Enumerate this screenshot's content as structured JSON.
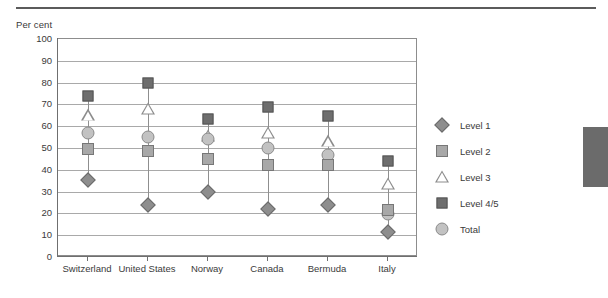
{
  "axis_unit_label": "Per cent",
  "legend": {
    "items": [
      {
        "label": "Level 1",
        "marker": "diamond-icon"
      },
      {
        "label": "Level 2",
        "marker": "square-light-icon"
      },
      {
        "label": "Level 3",
        "marker": "triangle-outline-icon"
      },
      {
        "label": "Level 4/5",
        "marker": "square-dark-icon"
      },
      {
        "label": "Total",
        "marker": "circle-icon"
      }
    ]
  },
  "colors": {
    "level1": "#8e8e8e",
    "level2": "#a8a8a8",
    "level3": "#ffffff",
    "level45": "#6e6e6e",
    "total": "#c2c2c2",
    "gridline": "#a9a9a9",
    "frame": "#8d8d8d",
    "text": "#3a3a3a",
    "edge_tab": "#6b6b6b",
    "top_rule": "#5b5b5b"
  },
  "chart_data": {
    "type": "scatter",
    "title": "",
    "subtitle": "",
    "xlabel": "",
    "ylabel": "Per cent",
    "ylim": [
      0,
      100
    ],
    "yticks": [
      0,
      10,
      20,
      30,
      40,
      50,
      60,
      70,
      80,
      90,
      100
    ],
    "ytick_labels": [
      "0",
      "10",
      "20",
      "30",
      "40",
      "50",
      "60",
      "70",
      "80",
      "90",
      "100"
    ],
    "grid": true,
    "legend_position": "right",
    "categories": [
      "Switzerland",
      "United States",
      "Norway",
      "Canada",
      "Bermuda",
      "Italy"
    ],
    "series": [
      {
        "name": "Level 1",
        "values": [
          35.5,
          24.0,
          30.0,
          22.0,
          24.0,
          11.5
        ]
      },
      {
        "name": "Level 2",
        "values": [
          49.5,
          48.5,
          45.0,
          42.0,
          42.0,
          21.5
        ]
      },
      {
        "name": "Level 3",
        "values": [
          65.0,
          68.0,
          55.5,
          57.0,
          53.0,
          33.5
        ]
      },
      {
        "name": "Level 4/5",
        "values": [
          74.0,
          80.0,
          63.5,
          69.0,
          64.5,
          44.0
        ]
      },
      {
        "name": "Total",
        "values": [
          57.0,
          55.0,
          54.0,
          50.0,
          47.0,
          19.5
        ]
      }
    ]
  }
}
